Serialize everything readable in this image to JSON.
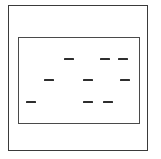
{
  "figure": {
    "background_color": "#ffffff",
    "width": 161,
    "height": 159
  },
  "outer_frame": {
    "name": "outer-rectangle",
    "stroke_color": "#3a3a3a",
    "stroke_width": 1.6,
    "x": 8,
    "y": 5,
    "width": 140,
    "height": 146
  },
  "inner_frame": {
    "name": "inner-rectangle",
    "stroke_color": "#4a4a4a",
    "stroke_width": 1.4,
    "x": 18,
    "y": 37,
    "width": 122,
    "height": 87
  },
  "dashes": {
    "color": "#2e2e2e",
    "count": 9,
    "rows": [
      {
        "row_label": "top-row",
        "y": 58,
        "items": [
          {
            "label": "dash-top-1",
            "x": 64,
            "width": 10,
            "height": 2.2
          },
          {
            "label": "dash-top-2",
            "x": 100,
            "width": 10,
            "height": 2.2
          },
          {
            "label": "dash-top-3",
            "x": 118,
            "width": 10,
            "height": 2.2
          }
        ]
      },
      {
        "row_label": "middle-row",
        "y": 79,
        "items": [
          {
            "label": "dash-mid-1",
            "x": 44,
            "width": 10,
            "height": 2.2
          },
          {
            "label": "dash-mid-2",
            "x": 83,
            "width": 10,
            "height": 2.2
          },
          {
            "label": "dash-mid-3",
            "x": 120,
            "width": 10,
            "height": 2.2
          }
        ]
      },
      {
        "row_label": "bottom-row",
        "y": 101,
        "items": [
          {
            "label": "dash-bot-1",
            "x": 26,
            "width": 10,
            "height": 2.4
          },
          {
            "label": "dash-bot-2",
            "x": 83,
            "width": 10,
            "height": 2.4
          },
          {
            "label": "dash-bot-3",
            "x": 103,
            "width": 10,
            "height": 2.4
          }
        ]
      }
    ]
  }
}
